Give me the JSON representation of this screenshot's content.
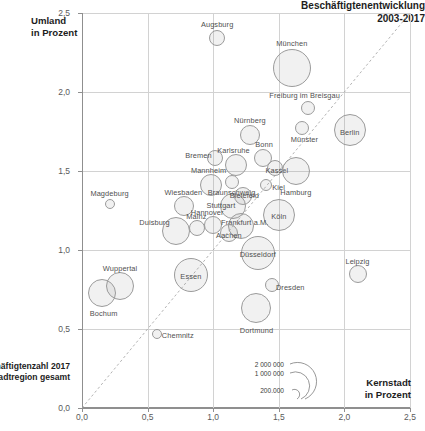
{
  "chart_data": {
    "type": "scatter",
    "title": "Beschäftigtenentwicklung 2003-2017",
    "title_line1": "Beschäftigtenentwicklung",
    "title_line2": "2003-2017",
    "xlabel_line1": "Kernstadt",
    "xlabel_line2": "in Prozent",
    "ylabel_line1": "Umland",
    "ylabel_line2": "in Prozent",
    "xlim": [
      0.0,
      2.5
    ],
    "ylim": [
      0.0,
      2.5
    ],
    "xticks": [
      "0,0",
      "0,5",
      "1,0",
      "1,5",
      "2,0",
      "2,5"
    ],
    "yticks": [
      "0,0",
      "0,5",
      "1,0",
      "1,5",
      "2,0",
      "2,5"
    ],
    "xtick_values": [
      0.0,
      0.5,
      1.0,
      1.5,
      2.0,
      2.5
    ],
    "ytick_values": [
      0.0,
      0.5,
      1.0,
      1.5,
      2.0,
      2.5
    ],
    "grid": true,
    "reference_line": "diagonal y = x",
    "size_meaning": "Beschäftigtenzahl 2017 je Stadtregion gesamt",
    "legend": {
      "title_line1": "Beschäftigtenzahl 2017",
      "title_line2": "je Stadtregion gesamt",
      "sizes": [
        "2 000 000",
        "1 000 000",
        "200.000"
      ],
      "size_values": [
        2000000,
        1000000,
        200000
      ],
      "position": "bottom-center"
    },
    "points": [
      {
        "name": "Augsburg",
        "x": 1.03,
        "y": 2.34,
        "r": 8,
        "lx": 0,
        "ly": -14
      },
      {
        "name": "München",
        "x": 1.6,
        "y": 2.15,
        "r": 19,
        "lx": 0,
        "ly": -25
      },
      {
        "name": "Freiburg im Breisgau",
        "x": 1.72,
        "y": 1.9,
        "r": 7,
        "lx": -3,
        "ly": -13
      },
      {
        "name": "Berlin",
        "x": 2.04,
        "y": 1.76,
        "r": 16,
        "lx": 0,
        "ly": 2
      },
      {
        "name": "Münster",
        "x": 1.68,
        "y": 1.77,
        "r": 7,
        "lx": 2,
        "ly": 11
      },
      {
        "name": "Nürnberg",
        "x": 1.28,
        "y": 1.73,
        "r": 10,
        "lx": 0,
        "ly": -15
      },
      {
        "name": "Bremen",
        "x": 1.01,
        "y": 1.58,
        "r": 8,
        "lx": -16,
        "ly": -3
      },
      {
        "name": "Karlsruhe",
        "x": 1.17,
        "y": 1.54,
        "r": 11,
        "lx": -2,
        "ly": -15
      },
      {
        "name": "Bonn",
        "x": 1.38,
        "y": 1.58,
        "r": 9,
        "lx": 1,
        "ly": -14
      },
      {
        "name": "Kassel",
        "x": 1.47,
        "y": 1.52,
        "r": 8,
        "lx": 2,
        "ly": 2
      },
      {
        "name": "Hamburg",
        "x": 1.63,
        "y": 1.5,
        "r": 14,
        "lx": 0,
        "ly": 21
      },
      {
        "name": "Mannheim",
        "x": 0.98,
        "y": 1.41,
        "r": 11,
        "lx": -2,
        "ly": -15
      },
      {
        "name": "Braunschweig",
        "x": 1.14,
        "y": 1.43,
        "r": 7,
        "lx": 0,
        "ly": 10
      },
      {
        "name": "Kiel",
        "x": 1.4,
        "y": 1.41,
        "r": 6,
        "lx": 13,
        "ly": 2
      },
      {
        "name": "Magdeburg",
        "x": 0.21,
        "y": 1.29,
        "r": 5,
        "lx": 0,
        "ly": -11
      },
      {
        "name": "Wiesbaden",
        "x": 0.78,
        "y": 1.28,
        "r": 10,
        "lx": -1,
        "ly": -14
      },
      {
        "name": "Stuttgart",
        "x": 1.15,
        "y": 1.28,
        "r": 13,
        "lx": -12,
        "ly": -1
      },
      {
        "name": "Bielefeld",
        "x": 1.23,
        "y": 1.34,
        "r": 9,
        "lx": 1,
        "ly": -1
      },
      {
        "name": "Köln",
        "x": 1.5,
        "y": 1.22,
        "r": 16,
        "lx": 0,
        "ly": 1
      },
      {
        "name": "Hannover",
        "x": 1.0,
        "y": 1.16,
        "r": 9,
        "lx": -6,
        "ly": -13
      },
      {
        "name": "Frankfurt a.M.",
        "x": 1.21,
        "y": 1.15,
        "r": 13,
        "lx": 4,
        "ly": -4
      },
      {
        "name": "Aachen",
        "x": 1.12,
        "y": 1.11,
        "r": 9,
        "lx": 0,
        "ly": 2
      },
      {
        "name": "Mainz",
        "x": 0.88,
        "y": 1.14,
        "r": 8,
        "lx": -1,
        "ly": -12
      },
      {
        "name": "Duisburg",
        "x": 0.72,
        "y": 1.12,
        "r": 14,
        "lx": -22,
        "ly": -9
      },
      {
        "name": "Düsseldorf",
        "x": 1.34,
        "y": 0.98,
        "r": 17,
        "lx": 0,
        "ly": 1
      },
      {
        "name": "Leipzig",
        "x": 2.1,
        "y": 0.85,
        "r": 9,
        "lx": 0,
        "ly": -13
      },
      {
        "name": "Essen",
        "x": 0.83,
        "y": 0.84,
        "r": 17,
        "lx": 0,
        "ly": 1
      },
      {
        "name": "Dresden",
        "x": 1.45,
        "y": 0.78,
        "r": 7,
        "lx": 18,
        "ly": 2
      },
      {
        "name": "Wuppertal",
        "x": 0.29,
        "y": 0.77,
        "r": 14,
        "lx": 0,
        "ly": -18
      },
      {
        "name": "Bochum",
        "x": 0.15,
        "y": 0.73,
        "r": 14,
        "lx": 2,
        "ly": 20
      },
      {
        "name": "Dortmund",
        "x": 1.33,
        "y": 0.63,
        "r": 15,
        "lx": 0,
        "ly": 22
      },
      {
        "name": "Chemnitz",
        "x": 0.57,
        "y": 0.47,
        "r": 5,
        "lx": 21,
        "ly": 1
      }
    ]
  }
}
